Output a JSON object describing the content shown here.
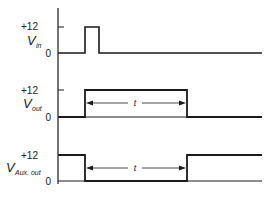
{
  "diagram": {
    "type": "timing-diagram",
    "axis": {
      "x": 58,
      "y_top": 8,
      "y_bottom": 184
    },
    "traces": [
      {
        "name": "V",
        "subscript": "in",
        "label_high": "+12",
        "label_low": "0",
        "y_high": 27,
        "y_low": 53,
        "pulse": {
          "start_x": 85,
          "end_x": 99
        },
        "end_x": 262
      },
      {
        "name": "V",
        "subscript": "out",
        "label_high": "+12",
        "label_low": "0",
        "y_high": 90,
        "y_low": 117,
        "pulse": {
          "start_x": 85,
          "end_x": 187
        },
        "end_x": 262,
        "duration_label": "t"
      },
      {
        "name": "V",
        "subscript": "Aux. out",
        "label_high": "+12",
        "label_low": "0",
        "y_high": 155,
        "y_low": 181,
        "low_pulse": {
          "start_x": 85,
          "end_x": 187
        },
        "end_x": 262,
        "duration_label": "t"
      }
    ],
    "stroke_color": "#1a1a1a"
  }
}
